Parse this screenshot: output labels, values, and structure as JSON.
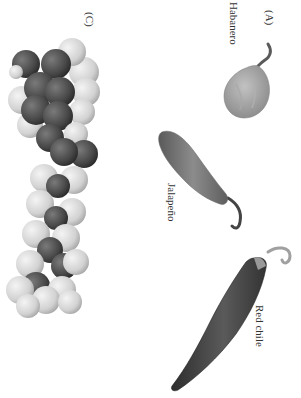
{
  "figure": {
    "orientation": "rotated-90-clockwise",
    "panels": {
      "A": {
        "label": "(A)",
        "peppers": [
          {
            "name": "Habanero"
          },
          {
            "name": "Jalapeño"
          },
          {
            "name": "Red chile"
          }
        ]
      },
      "C": {
        "label": "(C)",
        "content": "space-filling molecular model"
      }
    },
    "colors": {
      "background": "#ffffff",
      "text": "#333333",
      "dark_atom": "#4a4a4a",
      "light_atom": "#d8d8d8",
      "pepper_light": "#9a9a9a",
      "pepper_mid": "#6e6e6e",
      "pepper_dark": "#3c3c3c"
    }
  }
}
